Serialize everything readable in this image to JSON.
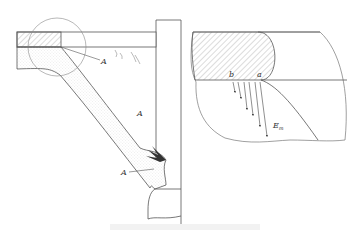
{
  "diagram": {
    "type": "technical-illustration",
    "left_panel": {
      "description": "Cross-section of a cantilever bracket welded to a vertical plate, with corrosion/crack initiation sites",
      "labels": [
        "A",
        "A",
        "A"
      ],
      "detail_circle": true
    },
    "right_panel": {
      "description": "Magnified detail of the circled region showing field lines",
      "labels": {
        "point_b": "b",
        "point_a": "a",
        "field": "E",
        "field_subscript": "m"
      }
    },
    "colors": {
      "line": "#555555",
      "hatch": "#999999",
      "stipple": "#bbbbbb",
      "dark": "#333333"
    }
  }
}
